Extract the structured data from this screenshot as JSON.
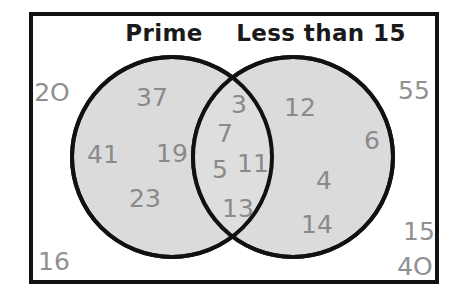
{
  "diagram": {
    "type": "venn-two-set",
    "border_color": "#111111",
    "circle_fill": "#d9d9d9",
    "circle_stroke": "#111111",
    "number_color": "#8a8a8a",
    "title_color": "#1a1a1a",
    "background": "#ffffff"
  },
  "titles": {
    "left": "Prime",
    "right": "Less than 15"
  },
  "regions": {
    "left_only": {
      "label": "Prime only",
      "values": [
        "37",
        "41",
        "19",
        "23"
      ]
    },
    "intersection": {
      "label": "Prime and Less than 15",
      "values": [
        "3",
        "7",
        "5",
        "11",
        "13"
      ]
    },
    "right_only": {
      "label": "Less than 15 only",
      "values": [
        "12",
        "6",
        "4",
        "14"
      ]
    },
    "outside": {
      "label": "Neither",
      "values": [
        "2O",
        "55",
        "16",
        "15",
        "4O"
      ]
    }
  },
  "placed_numbers": [
    {
      "id": "n-37",
      "text": "37",
      "x": 152,
      "y": 97,
      "region": "left_only"
    },
    {
      "id": "n-41",
      "text": "41",
      "x": 103,
      "y": 154,
      "region": "left_only"
    },
    {
      "id": "n-19",
      "text": "19",
      "x": 172,
      "y": 153,
      "region": "left_only"
    },
    {
      "id": "n-23",
      "text": "23",
      "x": 145,
      "y": 198,
      "region": "left_only"
    },
    {
      "id": "n-3",
      "text": "3",
      "x": 239,
      "y": 104,
      "region": "intersection"
    },
    {
      "id": "n-7",
      "text": "7",
      "x": 225,
      "y": 133,
      "region": "intersection"
    },
    {
      "id": "n-5",
      "text": "5",
      "x": 220,
      "y": 169,
      "region": "intersection"
    },
    {
      "id": "n-11",
      "text": "11",
      "x": 253,
      "y": 163,
      "region": "intersection"
    },
    {
      "id": "n-13",
      "text": "13",
      "x": 238,
      "y": 208,
      "region": "intersection"
    },
    {
      "id": "n-12",
      "text": "12",
      "x": 300,
      "y": 107,
      "region": "right_only"
    },
    {
      "id": "n-6",
      "text": "6",
      "x": 372,
      "y": 140,
      "region": "right_only"
    },
    {
      "id": "n-4",
      "text": "4",
      "x": 324,
      "y": 180,
      "region": "right_only"
    },
    {
      "id": "n-14",
      "text": "14",
      "x": 317,
      "y": 224,
      "region": "right_only"
    },
    {
      "id": "n-20",
      "text": "2O",
      "x": 52,
      "y": 92,
      "region": "outside"
    },
    {
      "id": "n-55",
      "text": "55",
      "x": 414,
      "y": 90,
      "region": "outside"
    },
    {
      "id": "n-16",
      "text": "16",
      "x": 54,
      "y": 261,
      "region": "outside"
    },
    {
      "id": "n-15",
      "text": "15",
      "x": 419,
      "y": 231,
      "region": "outside"
    },
    {
      "id": "n-40",
      "text": "4O",
      "x": 415,
      "y": 266,
      "region": "outside"
    }
  ],
  "geometry": {
    "rect": {
      "x": 31,
      "y": 14,
      "w": 406,
      "h": 268
    },
    "left_circle": {
      "cx": 172,
      "cy": 157,
      "r": 100
    },
    "right_circle": {
      "cx": 293,
      "cy": 157,
      "r": 100
    }
  }
}
